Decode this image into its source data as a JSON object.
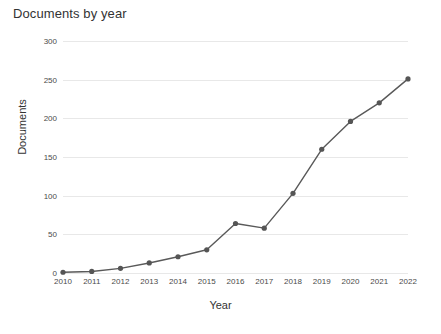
{
  "chart_data": {
    "type": "line",
    "title": "Documents by year",
    "xlabel": "Year",
    "ylabel": "Documents",
    "categories": [
      "2010",
      "2011",
      "2012",
      "2013",
      "2014",
      "2015",
      "2016",
      "2017",
      "2018",
      "2019",
      "2020",
      "2021",
      "2022"
    ],
    "x": [
      2010,
      2011,
      2012,
      2013,
      2014,
      2015,
      2016,
      2017,
      2018,
      2019,
      2020,
      2021,
      2022
    ],
    "values": [
      1,
      2,
      6,
      13,
      21,
      30,
      64,
      58,
      103,
      160,
      196,
      220,
      251
    ],
    "series": [
      {
        "name": "Documents",
        "values": [
          1,
          2,
          6,
          13,
          21,
          30,
          64,
          58,
          103,
          160,
          196,
          220,
          251
        ]
      }
    ],
    "ylim": [
      0,
      300
    ],
    "yticks": [
      0,
      50,
      100,
      150,
      200,
      250,
      300
    ],
    "ytick_labels": [
      "0",
      "50",
      "100",
      "150",
      "200",
      "250",
      "300"
    ],
    "xlim": [
      2010,
      2022
    ],
    "grid": "horizontal",
    "legend": "none",
    "line_color": "#595959",
    "marker_color": "#555555",
    "marker": "circle",
    "grid_color": "#e8e8e8",
    "background_color": "#ffffff"
  }
}
